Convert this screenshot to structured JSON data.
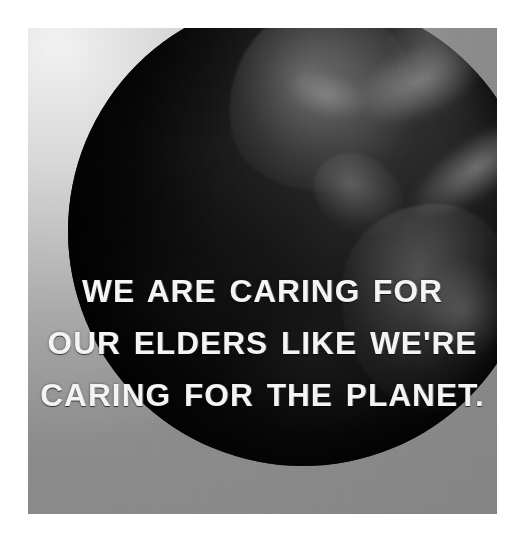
{
  "poster": {
    "kind": "inspirational-quote-image",
    "border_color": "#ffffff",
    "background_color": "#848484",
    "globe_color": "#0d0d0d",
    "text_color": "#f4f4f2"
  },
  "image": {
    "subject": "earth-globe",
    "description": "Dark grayscale photograph of planet Earth showing North, Central and South America",
    "alt": "Planet Earth seen from space in black and white"
  },
  "caption": {
    "line1": "WE ARE CARING FOR",
    "line2": "OUR ELDERS LIKE WE'RE",
    "line3": "CARING FOR THE PLANET.",
    "full_text": "WE ARE CARING FOR OUR ELDERS LIKE WE'RE CARING FOR THE PLANET.",
    "alignment": "center",
    "style": "bold-condensed-distressed-uppercase"
  }
}
